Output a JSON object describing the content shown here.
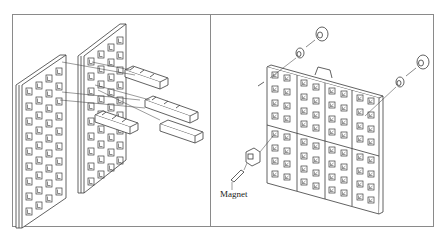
{
  "figure": {
    "panels": [
      {
        "id": "left",
        "description": "exploded view: two perforated panels with three connector bars"
      },
      {
        "id": "right",
        "description": "assembled 4x2 perforated panel grid with fasteners and magnet"
      }
    ],
    "labels": {
      "magnet": "Magnet"
    },
    "colors": {
      "line": "#3a3a3a",
      "frame": "#8a8a8a",
      "background": "#ffffff"
    }
  }
}
